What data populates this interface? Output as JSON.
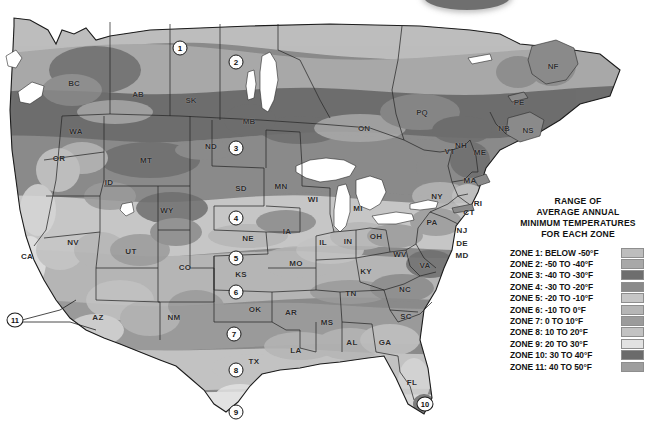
{
  "legend": {
    "title_lines": [
      "RANGE OF",
      "AVERAGE ANNUAL",
      "MINIMUM TEMPERATURES",
      "FOR EACH ZONE"
    ],
    "rows": [
      {
        "label": "ZONE 1: BELOW -50°F",
        "color": "#bdbdbd"
      },
      {
        "label": "ZONE 2: -50 TO -40°F",
        "color": "#a8a8a8"
      },
      {
        "label": "ZONE 3: -40 TO -30°F",
        "color": "#6e6e6e"
      },
      {
        "label": "ZONE 4: -30 TO -20°F",
        "color": "#8a8a8a"
      },
      {
        "label": "ZONE 5: -20 TO -10°F",
        "color": "#c6c6c6"
      },
      {
        "label": "ZONE 6: -10 TO 0°F",
        "color": "#b5b5b5"
      },
      {
        "label": "ZONE 7: 0 TO 10°F",
        "color": "#9b9b9b"
      },
      {
        "label": "ZONE 8: 10 TO 20°F",
        "color": "#c2c2c2"
      },
      {
        "label": "ZONE 9: 20 TO 30°F",
        "color": "#e2e2e2"
      },
      {
        "label": "ZONE 10: 30 TO 40°F",
        "color": "#6b6b6b"
      },
      {
        "label": "ZONE 11: 40 TO 50°F",
        "color": "#9e9e9e"
      }
    ]
  },
  "map": {
    "zone_markers": [
      {
        "id": "1",
        "x": 180,
        "y": 48
      },
      {
        "id": "2",
        "x": 236,
        "y": 62
      },
      {
        "id": "3",
        "x": 236,
        "y": 148
      },
      {
        "id": "4",
        "x": 236,
        "y": 218
      },
      {
        "id": "5",
        "x": 236,
        "y": 258
      },
      {
        "id": "6",
        "x": 236,
        "y": 292
      },
      {
        "id": "7",
        "x": 234,
        "y": 334
      },
      {
        "id": "8",
        "x": 236,
        "y": 370
      },
      {
        "id": "9",
        "x": 236,
        "y": 412
      },
      {
        "id": "10",
        "x": 425,
        "y": 404
      },
      {
        "id": "11",
        "x": 15,
        "y": 320
      }
    ],
    "us_states": [
      {
        "code": "WA",
        "x": 76,
        "y": 131
      },
      {
        "code": "OR",
        "x": 59,
        "y": 158
      },
      {
        "code": "ID",
        "x": 109,
        "y": 182
      },
      {
        "code": "MT",
        "x": 146,
        "y": 160
      },
      {
        "code": "WY",
        "x": 167,
        "y": 210
      },
      {
        "code": "ND",
        "x": 211,
        "y": 146
      },
      {
        "code": "SD",
        "x": 241,
        "y": 188
      },
      {
        "code": "NE",
        "x": 248,
        "y": 238
      },
      {
        "code": "KS",
        "x": 241,
        "y": 274
      },
      {
        "code": "OK",
        "x": 255,
        "y": 309
      },
      {
        "code": "TX",
        "x": 254,
        "y": 361
      },
      {
        "code": "NV",
        "x": 73,
        "y": 242
      },
      {
        "code": "UT",
        "x": 131,
        "y": 251
      },
      {
        "code": "CO",
        "x": 185,
        "y": 267
      },
      {
        "code": "CA",
        "x": 27,
        "y": 256
      },
      {
        "code": "AZ",
        "x": 98,
        "y": 317
      },
      {
        "code": "NM",
        "x": 174,
        "y": 317
      },
      {
        "code": "MN",
        "x": 281,
        "y": 186
      },
      {
        "code": "IA",
        "x": 287,
        "y": 231
      },
      {
        "code": "MO",
        "x": 296,
        "y": 263
      },
      {
        "code": "AR",
        "x": 291,
        "y": 312
      },
      {
        "code": "LA",
        "x": 296,
        "y": 350
      },
      {
        "code": "MS",
        "x": 327,
        "y": 322
      },
      {
        "code": "AL",
        "x": 352,
        "y": 342
      },
      {
        "code": "WI",
        "x": 313,
        "y": 199
      },
      {
        "code": "IL",
        "x": 323,
        "y": 242
      },
      {
        "code": "IN",
        "x": 348,
        "y": 241
      },
      {
        "code": "MI",
        "x": 358,
        "y": 208
      },
      {
        "code": "OH",
        "x": 376,
        "y": 236
      },
      {
        "code": "KY",
        "x": 366,
        "y": 271
      },
      {
        "code": "TN",
        "x": 351,
        "y": 293
      },
      {
        "code": "GA",
        "x": 385,
        "y": 342
      },
      {
        "code": "FL",
        "x": 412,
        "y": 382
      },
      {
        "code": "SC",
        "x": 406,
        "y": 316
      },
      {
        "code": "NC",
        "x": 405,
        "y": 289
      },
      {
        "code": "VA",
        "x": 425,
        "y": 265
      },
      {
        "code": "WV",
        "x": 400,
        "y": 254
      },
      {
        "code": "PA",
        "x": 432,
        "y": 222
      },
      {
        "code": "NY",
        "x": 437,
        "y": 196
      },
      {
        "code": "MD",
        "x": 462,
        "y": 255
      },
      {
        "code": "DE",
        "x": 462,
        "y": 243
      },
      {
        "code": "NJ",
        "x": 462,
        "y": 230
      },
      {
        "code": "CT",
        "x": 469,
        "y": 212
      },
      {
        "code": "RI",
        "x": 478,
        "y": 203
      },
      {
        "code": "MA",
        "x": 470,
        "y": 180
      },
      {
        "code": "VT",
        "x": 450,
        "y": 151
      },
      {
        "code": "NH",
        "x": 461,
        "y": 145
      },
      {
        "code": "ME",
        "x": 480,
        "y": 152
      }
    ],
    "provinces": [
      {
        "code": "BC",
        "x": 74,
        "y": 83
      },
      {
        "code": "AB",
        "x": 138,
        "y": 94
      },
      {
        "code": "SK",
        "x": 191,
        "y": 100
      },
      {
        "code": "MB",
        "x": 249,
        "y": 121
      },
      {
        "code": "ON",
        "x": 364,
        "y": 128
      },
      {
        "code": "PQ",
        "x": 422,
        "y": 112
      },
      {
        "code": "NB",
        "x": 504,
        "y": 128
      },
      {
        "code": "NS",
        "x": 528,
        "y": 130
      },
      {
        "code": "PE",
        "x": 519,
        "y": 102
      },
      {
        "code": "NF",
        "x": 553,
        "y": 66
      }
    ]
  }
}
